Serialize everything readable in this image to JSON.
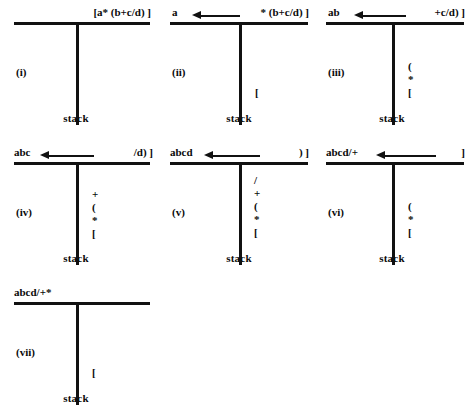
{
  "figure": {
    "caption": "",
    "stack_label": "stack",
    "panels": [
      {
        "roman": "(i)",
        "output": "",
        "input": "[a* (b+c/d) ]",
        "has_arrow": false,
        "stack": []
      },
      {
        "roman": "(ii)",
        "output": "a",
        "input": "* (b+c/d) ]",
        "has_arrow": true,
        "stack": [
          "["
        ]
      },
      {
        "roman": "(iii)",
        "output": "ab",
        "input": "+c/d) ]",
        "has_arrow": true,
        "stack": [
          "(",
          "*",
          "["
        ]
      },
      {
        "roman": "(iv)",
        "output": "abc",
        "input": "/d) ]",
        "has_arrow": true,
        "stack": [
          "+",
          "(",
          "*",
          "["
        ]
      },
      {
        "roman": "(v)",
        "output": "abcd",
        "input": ") ]",
        "has_arrow": true,
        "stack": [
          "/",
          "+",
          "(",
          "*",
          "["
        ]
      },
      {
        "roman": "(vi)",
        "output": "abcd/+",
        "input": "]",
        "has_arrow": true,
        "stack": [
          "(",
          "*",
          "["
        ]
      },
      {
        "roman": "(vii)",
        "output": "abcd/+*",
        "input": "",
        "has_arrow": false,
        "stack": [
          "["
        ]
      }
    ]
  },
  "colors": {
    "ink": "#111111",
    "background": "#ffffff"
  }
}
